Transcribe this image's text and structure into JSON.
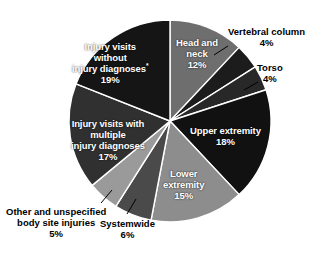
{
  "chart_data": {
    "type": "pie",
    "title": "",
    "subtitle": "",
    "xlabel": "",
    "ylabel": "",
    "units": "percent",
    "legend_position": "none",
    "labels_inside": true,
    "total": 100,
    "categories": [
      "Head and neck",
      "Vertebral column",
      "Torso",
      "Upper extremity",
      "Lower extremity",
      "Systemwide",
      "Other and unspecified body site injuries",
      "Injury visits with multiple injury diagnoses",
      "Injury visits without injury diagnoses"
    ],
    "values": [
      12,
      4,
      4,
      18,
      15,
      6,
      5,
      17,
      19
    ],
    "slices": [
      {
        "id": "head-and-neck",
        "label": "Head and\nneck",
        "label_lines": [
          "Head and",
          "neck"
        ],
        "value": 12,
        "value_text": "12%",
        "color": "#6e6e6e",
        "label_placement": "inside",
        "label_color": "#ffffff",
        "footnote_marker": ""
      },
      {
        "id": "vertebral-column",
        "label": "Vertebral column",
        "label_lines": [
          "Vertebral column"
        ],
        "value": 4,
        "value_text": "4%",
        "color": "#1c1c1c",
        "label_placement": "outside",
        "label_color": "#000000",
        "footnote_marker": ""
      },
      {
        "id": "torso",
        "label": "Torso",
        "label_lines": [
          "Torso"
        ],
        "value": 4,
        "value_text": "4%",
        "color": "#282828",
        "label_placement": "outside",
        "label_color": "#000000",
        "footnote_marker": ""
      },
      {
        "id": "upper-extremity",
        "label": "Upper extremity",
        "label_lines": [
          "Upper extremity"
        ],
        "value": 18,
        "value_text": "18%",
        "color": "#111111",
        "label_placement": "inside",
        "label_color": "#ffffff",
        "footnote_marker": ""
      },
      {
        "id": "lower-extremity",
        "label": "Lower\nextremity",
        "label_lines": [
          "Lower",
          "extremity"
        ],
        "value": 15,
        "value_text": "15%",
        "color": "#8d8d8d",
        "label_placement": "inside",
        "label_color": "#ffffff",
        "footnote_marker": ""
      },
      {
        "id": "systemwide",
        "label": "Systemwide",
        "label_lines": [
          "Systemwide"
        ],
        "value": 6,
        "value_text": "6%",
        "color": "#4a4a4a",
        "label_placement": "outside",
        "label_color": "#000000",
        "footnote_marker": ""
      },
      {
        "id": "other-unspecified",
        "label": "Other and unspecified\nbody site injuries",
        "label_lines": [
          "Other and unspecified",
          "body site injuries"
        ],
        "value": 5,
        "value_text": "5%",
        "color": "#9a9a9a",
        "label_placement": "outside",
        "label_color": "#000000",
        "footnote_marker": ""
      },
      {
        "id": "injury-visits-multiple",
        "label": "Injury visits with\nmultiple\ninjury diagnoses",
        "label_lines": [
          "Injury visits with",
          "multiple",
          "injury diagnoses"
        ],
        "value": 17,
        "value_text": "17%",
        "color": "#303030",
        "label_placement": "inside",
        "label_color": "#ffffff",
        "footnote_marker": ""
      },
      {
        "id": "injury-visits-without",
        "label": "Injury visits\nwithout\ninjury diagnoses",
        "label_lines": [
          "Injury visits",
          "without",
          "injury diagnoses"
        ],
        "value": 19,
        "value_text": "19%",
        "color": "#151515",
        "label_placement": "inside",
        "label_color": "#ffffff",
        "footnote_marker": "*"
      }
    ],
    "geometry": {
      "center_x": 170,
      "center_y": 121,
      "radius": 101,
      "start_angle_deg": 0,
      "direction": "clockwise",
      "separator_color": "#ffffff"
    },
    "background_color": "#ffffff"
  },
  "labels": {
    "head_and_neck": {
      "line1": "Head and",
      "line2": "neck",
      "pct": "12%"
    },
    "vertebral_column": {
      "line1": "Vertebral column",
      "pct": "4%"
    },
    "torso": {
      "line1": "Torso",
      "pct": "4%"
    },
    "upper_extremity": {
      "line1": "Upper extremity",
      "pct": "18%"
    },
    "lower_extremity": {
      "line1": "Lower",
      "line2": "extremity",
      "pct": "15%"
    },
    "systemwide": {
      "line1": "Systemwide",
      "pct": "6%"
    },
    "other_unspecified": {
      "line1": "Other and unspecified",
      "line2": "body site injuries",
      "pct": "5%"
    },
    "injury_multiple": {
      "line1": "Injury visits with",
      "line2": "multiple",
      "line3": "injury diagnoses",
      "pct": "17%"
    },
    "injury_without": {
      "line1": "Injury visits",
      "line2": "without",
      "line3": "injury diagnoses",
      "sup": "*",
      "pct": "19%"
    }
  }
}
